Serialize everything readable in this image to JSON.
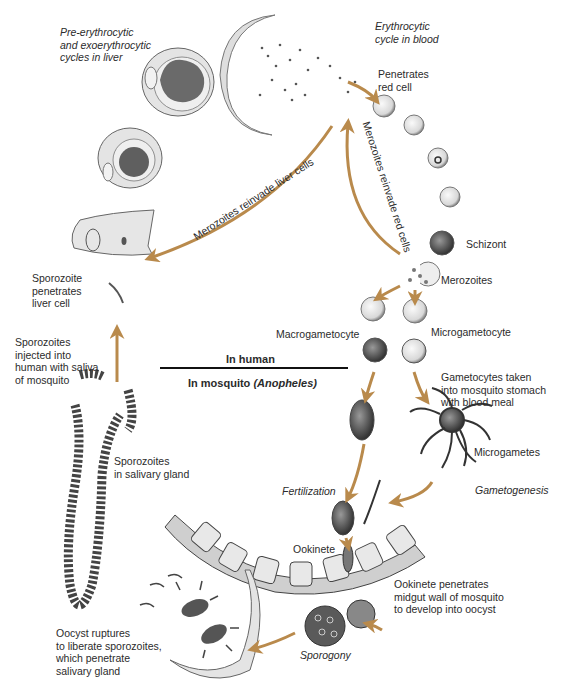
{
  "diagram": {
    "arrow_color": "#b98a4c",
    "divider": {
      "top_label": "In human",
      "bottom_label": "In mosquito",
      "bottom_label_italic": "(Anopheles)"
    },
    "labels": {
      "liver_cycle": "Pre-erythrocytic\nand exoerythrocytic\ncycles in liver",
      "blood_cycle": "Erythrocytic\ncycle in blood",
      "penetrates": "Penetrates\nred cell",
      "reinvade_liver": "Merozoites reinvade liver cells",
      "reinvade_red": "Merozoites reinvade red cells",
      "schizont": "Schizont",
      "merozoites": "Merozoites",
      "sporozoite_penetrates": "Sporozoite\npenetrates\nliver cell",
      "sporozoites_injected": "Sporozoites\ninjected into\nhuman with saliva\nof mosquito",
      "macrogametocyte": "Macrogametocyte",
      "microgametocyte": "Microgametocyte",
      "gametocytes_taken": "Gametocytes taken\ninto mosquito stomach\nwith blood meal",
      "sporozoites_gland": "Sporozoites\nin salivary gland",
      "microgametes": "Microgametes",
      "gametogenesis": "Gametogenesis",
      "fertilization": "Fertilization",
      "ookinete": "Ookinete",
      "ookinete_penetrates": "Ookinete penetrates\nmidgut wall of mosquito\nto develop into oocyst",
      "oocyst_ruptures": "Oocyst ruptures\nto liberate sporozoites,\nwhich penetrate\nsalivary gland",
      "sporogony": "Sporogony"
    }
  }
}
